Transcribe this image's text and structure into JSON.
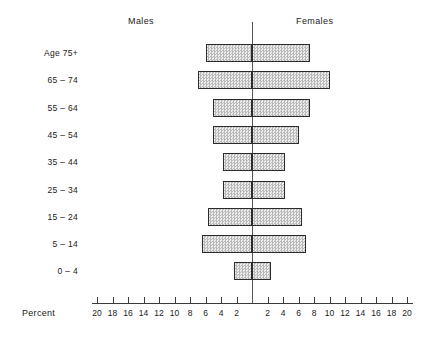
{
  "chart_data": {
    "type": "bar",
    "chart_style": "population-pyramid",
    "title": "",
    "xlabel": "Percent",
    "ylabel": "Age",
    "xlim": [
      -20,
      20
    ],
    "grid": false,
    "axis_unit": "percent",
    "categories": [
      "75+",
      "65 – 74",
      "55 – 64",
      "45 – 54",
      "35 – 44",
      "25 – 34",
      "15 – 24",
      "5 – 14",
      "0 – 4"
    ],
    "series": [
      {
        "name": "Males",
        "side": "left",
        "values": [
          6.0,
          7.0,
          5.0,
          5.0,
          3.8,
          3.8,
          5.7,
          6.5,
          2.3
        ]
      },
      {
        "name": "Females",
        "side": "right",
        "values": [
          7.5,
          10.0,
          7.5,
          6.0,
          4.2,
          4.2,
          6.5,
          7.0,
          2.4
        ]
      }
    ],
    "tick_values_left": [
      20,
      18,
      16,
      14,
      12,
      10,
      8,
      6,
      4,
      2
    ],
    "tick_values_right": [
      2,
      4,
      6,
      8,
      10,
      12,
      14,
      16,
      18,
      20
    ],
    "legend": [
      "Males",
      "Females"
    ],
    "legend_position": "top"
  },
  "labels": {
    "males": "Males",
    "females": "Females",
    "age_prefix": "Age",
    "percent": "Percent"
  },
  "colors": {
    "bar_fill": "#cfcfcf",
    "bar_border": "#2b2b2b",
    "axis": "#3a3a3a",
    "center_axis": "#555555",
    "text": "#1a1a1a",
    "background": "#ffffff"
  }
}
